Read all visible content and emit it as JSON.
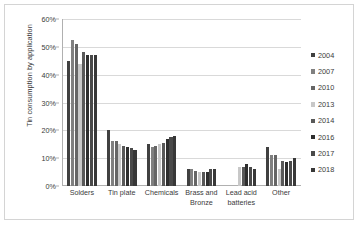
{
  "chart_data": {
    "type": "bar",
    "title": "",
    "xlabel": "",
    "ylabel": "Tin consumption by application",
    "ylim": [
      0,
      60
    ],
    "y_tick_labels": [
      "0%",
      "10%",
      "20%",
      "30%",
      "40%",
      "50%",
      "60%"
    ],
    "y_tick_values": [
      0,
      10,
      20,
      30,
      40,
      50,
      60
    ],
    "grid": true,
    "legend_position": "right",
    "units": "percent",
    "categories": [
      "Solders",
      "Tin plate",
      "Chemicals",
      "Brass and Bronze",
      "Lead acid batteries",
      "Other"
    ],
    "series": [
      {
        "name": "2004",
        "color": "#404040",
        "values": [
          45,
          20,
          15,
          6,
          null,
          14
        ]
      },
      {
        "name": "2007",
        "color": "#808080",
        "values": [
          52.5,
          16,
          14,
          6,
          null,
          11
        ]
      },
      {
        "name": "2010",
        "color": "#666666",
        "values": [
          51,
          16,
          14.5,
          5.5,
          null,
          11
        ]
      },
      {
        "name": "2013",
        "color": "#c8c8c8",
        "values": [
          44,
          15,
          15,
          5,
          7,
          6
        ]
      },
      {
        "name": "2014",
        "color": "#595959",
        "values": [
          48,
          14.5,
          15.5,
          5,
          7,
          9
        ]
      },
      {
        "name": "2016",
        "color": "#2e2e2e",
        "values": [
          47,
          14,
          17,
          5,
          8,
          8.5
        ]
      },
      {
        "name": "2017",
        "color": "#4a4a4a",
        "values": [
          47,
          13.5,
          17.5,
          6,
          7,
          9
        ]
      },
      {
        "name": "2018",
        "color": "#383838",
        "values": [
          47,
          13,
          18,
          6,
          6,
          10
        ]
      }
    ]
  },
  "legend": {
    "items": [
      {
        "label": "2004"
      },
      {
        "label": "2007"
      },
      {
        "label": "2010"
      },
      {
        "label": "2013"
      },
      {
        "label": "2014"
      },
      {
        "label": "2016"
      },
      {
        "label": "2017"
      },
      {
        "label": "2018"
      }
    ]
  }
}
